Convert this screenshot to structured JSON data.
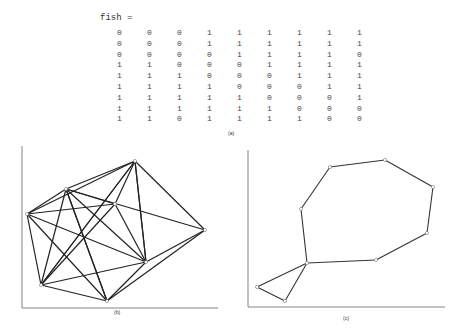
{
  "figure": {
    "variable_line": "fish =",
    "matrix": [
      [
        "0",
        "0",
        "0",
        "1",
        "1",
        "1",
        "1",
        "1",
        "1"
      ],
      [
        "0",
        "0",
        "0",
        "1",
        "1",
        "1",
        "1",
        "1",
        "1"
      ],
      [
        "0",
        "0",
        "0",
        "0",
        "1",
        "1",
        "1",
        "1",
        "0"
      ],
      [
        "1",
        "1",
        "0",
        "0",
        "0",
        "1",
        "1",
        "1",
        "1"
      ],
      [
        "1",
        "1",
        "1",
        "0",
        "0",
        "0",
        "1",
        "1",
        "1"
      ],
      [
        "1",
        "1",
        "1",
        "1",
        "0",
        "0",
        "0",
        "1",
        "1"
      ],
      [
        "1",
        "1",
        "1",
        "1",
        "1",
        "0",
        "0",
        "0",
        "1"
      ],
      [
        "1",
        "1",
        "1",
        "1",
        "1",
        "1",
        "0",
        "0",
        "0"
      ],
      [
        "1",
        "1",
        "0",
        "1",
        "1",
        "1",
        "1",
        "0",
        "0"
      ]
    ],
    "captions": {
      "a": "(a)",
      "b": "(b)",
      "c": "(c)"
    }
  },
  "graph_b": {
    "nodes": [
      [
        66,
        189
      ],
      [
        135,
        161
      ],
      [
        27,
        214
      ],
      [
        41,
        285
      ],
      [
        107,
        301
      ],
      [
        146,
        262
      ],
      [
        205,
        230
      ],
      [
        115,
        204
      ]
    ],
    "edges": [
      [
        0,
        1
      ],
      [
        0,
        2
      ],
      [
        0,
        3
      ],
      [
        0,
        4
      ],
      [
        0,
        5
      ],
      [
        0,
        7
      ],
      [
        0,
        6
      ],
      [
        1,
        2
      ],
      [
        1,
        7
      ],
      [
        1,
        6
      ],
      [
        1,
        3
      ],
      [
        1,
        5
      ],
      [
        2,
        7
      ],
      [
        2,
        3
      ],
      [
        2,
        4
      ],
      [
        2,
        5
      ],
      [
        3,
        7
      ],
      [
        3,
        5
      ],
      [
        3,
        4
      ],
      [
        3,
        1
      ],
      [
        4,
        6
      ],
      [
        4,
        5
      ],
      [
        4,
        0
      ],
      [
        7,
        5
      ],
      [
        6,
        5
      ],
      [
        5,
        1
      ]
    ]
  },
  "graph_c": {
    "nodes": [
      [
        330,
        167
      ],
      [
        385,
        160
      ],
      [
        433,
        187
      ],
      [
        427,
        233
      ],
      [
        376,
        260
      ],
      [
        307,
        263
      ],
      [
        301,
        209
      ],
      [
        257,
        287
      ],
      [
        285,
        301
      ]
    ],
    "edges": [
      [
        0,
        1
      ],
      [
        1,
        2
      ],
      [
        2,
        3
      ],
      [
        3,
        4
      ],
      [
        4,
        5
      ],
      [
        5,
        6
      ],
      [
        6,
        0
      ],
      [
        5,
        7
      ],
      [
        7,
        8
      ],
      [
        8,
        5
      ]
    ]
  }
}
